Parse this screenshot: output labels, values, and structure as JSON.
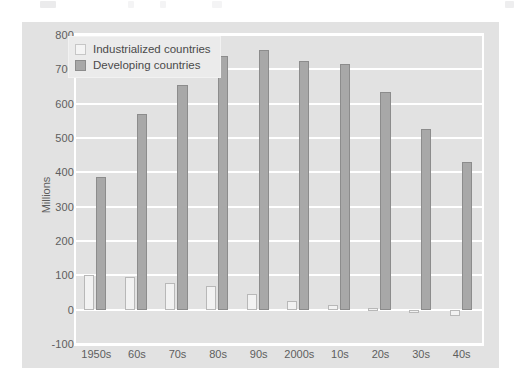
{
  "window": {
    "background_color": "#ffffff"
  },
  "chart_card": {
    "background_color": "#e2e2e2",
    "plot_border_color": "#ffffff"
  },
  "legend": {
    "position": "top-left-inside",
    "entries": [
      {
        "label": "Industrialized countries",
        "swatch": "legend-swatch-industrialized",
        "color": "#f4f4f4"
      },
      {
        "label": "Developing countries",
        "swatch": "legend-swatch-developing",
        "color": "#a8a8a8"
      }
    ]
  },
  "chart_data": {
    "type": "bar",
    "title": "",
    "xlabel": "",
    "ylabel": "Millions",
    "ylim": [
      -100,
      800
    ],
    "ytick_step": 100,
    "yticks": [
      800,
      700,
      600,
      500,
      400,
      300,
      200,
      100,
      0,
      -100
    ],
    "ytick_labels": [
      "800",
      "700",
      "600",
      "500",
      "400",
      "300",
      "200",
      "100",
      "0",
      "-100"
    ],
    "grid": true,
    "grid_axis": "y",
    "legend_position": "upper left",
    "categories": [
      "1950s",
      "60s",
      "70s",
      "80s",
      "90s",
      "2000s",
      "10s",
      "20s",
      "30s",
      "40s"
    ],
    "series": [
      {
        "name": "Industrialized countries",
        "color": "#f2f2f2",
        "values": [
          100,
          95,
          78,
          70,
          45,
          25,
          15,
          5,
          -8,
          -18
        ]
      },
      {
        "name": "Developing countries",
        "color": "#a8a8a8",
        "values": [
          385,
          570,
          655,
          740,
          755,
          725,
          715,
          635,
          525,
          430
        ]
      }
    ]
  }
}
